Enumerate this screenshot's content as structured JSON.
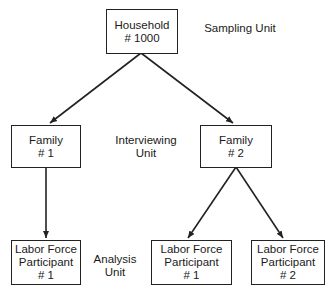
{
  "nodes": {
    "household": {
      "line1": "Household",
      "line2": "# 1000"
    },
    "family1": {
      "line1": "Family",
      "line2": "# 1"
    },
    "family2": {
      "line1": "Family",
      "line2": "# 2"
    },
    "lfp_f1_1": {
      "line1": "Labor Force",
      "line2": "Participant",
      "line3": "# 1"
    },
    "lfp_f2_1": {
      "line1": "Labor Force",
      "line2": "Participant",
      "line3": "# 1"
    },
    "lfp_f2_2": {
      "line1": "Labor Force",
      "line2": "Participant",
      "line3": "# 2"
    }
  },
  "levels": {
    "sampling": {
      "line1": "Sampling Unit"
    },
    "interviewing": {
      "line1": "Interviewing",
      "line2": "Unit"
    },
    "analysis": {
      "line1": "Analysis",
      "line2": "Unit"
    }
  },
  "edges": [
    {
      "from": "household",
      "to": "family1"
    },
    {
      "from": "household",
      "to": "family2"
    },
    {
      "from": "family1",
      "to": "lfp_f1_1"
    },
    {
      "from": "family2",
      "to": "lfp_f2_1"
    },
    {
      "from": "family2",
      "to": "lfp_f2_2"
    }
  ]
}
